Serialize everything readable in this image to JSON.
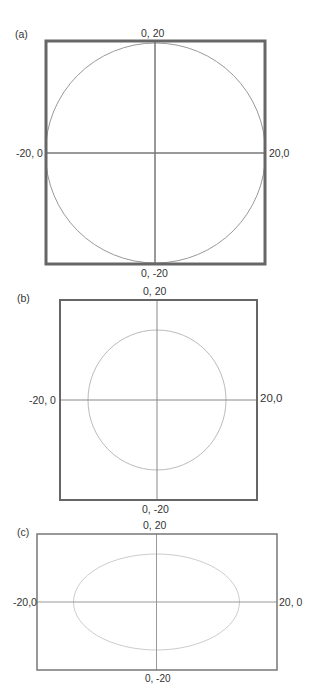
{
  "figure": {
    "panels": [
      {
        "id": "a",
        "label": "(a)",
        "top_label": "0, 20",
        "bottom_label": "0, -20",
        "left_label": "-20, 0",
        "right_label": "20,0",
        "shape": "circle",
        "box": {
          "x": 46,
          "y": 41,
          "w": 219,
          "h": 223,
          "stroke": "#666666",
          "stroke_width": 3
        },
        "curve": {
          "cx": 155.5,
          "cy": 153,
          "rx": 109.5,
          "ry": 111,
          "stroke": "#999999"
        },
        "axis_color": "#777777"
      },
      {
        "id": "b",
        "label": "(b)",
        "top_label": "0, 20",
        "bottom_label": "0, -20",
        "left_label": "-20, 0",
        "right_label": "20,0",
        "shape": "circle",
        "box": {
          "x": 60,
          "y": 300,
          "w": 197,
          "h": 200,
          "stroke": "#666666",
          "stroke_width": 2
        },
        "curve": {
          "cx": 157,
          "cy": 400,
          "rx": 69,
          "ry": 70,
          "stroke": "#bbbbbb"
        },
        "axis_color": "#888888"
      },
      {
        "id": "c",
        "label": "(c)",
        "top_label": "0, 20",
        "bottom_label": "0, -20",
        "left_label": "-20,0",
        "right_label": "20, 0",
        "shape": "ellipse",
        "box": {
          "x": 37,
          "y": 534,
          "w": 240,
          "h": 136,
          "stroke": "#777777",
          "stroke_width": 1.5
        },
        "curve": {
          "cx": 156.5,
          "cy": 602,
          "rx": 83,
          "ry": 48,
          "stroke": "#cccccc"
        },
        "axis_color": "#999999"
      }
    ]
  }
}
